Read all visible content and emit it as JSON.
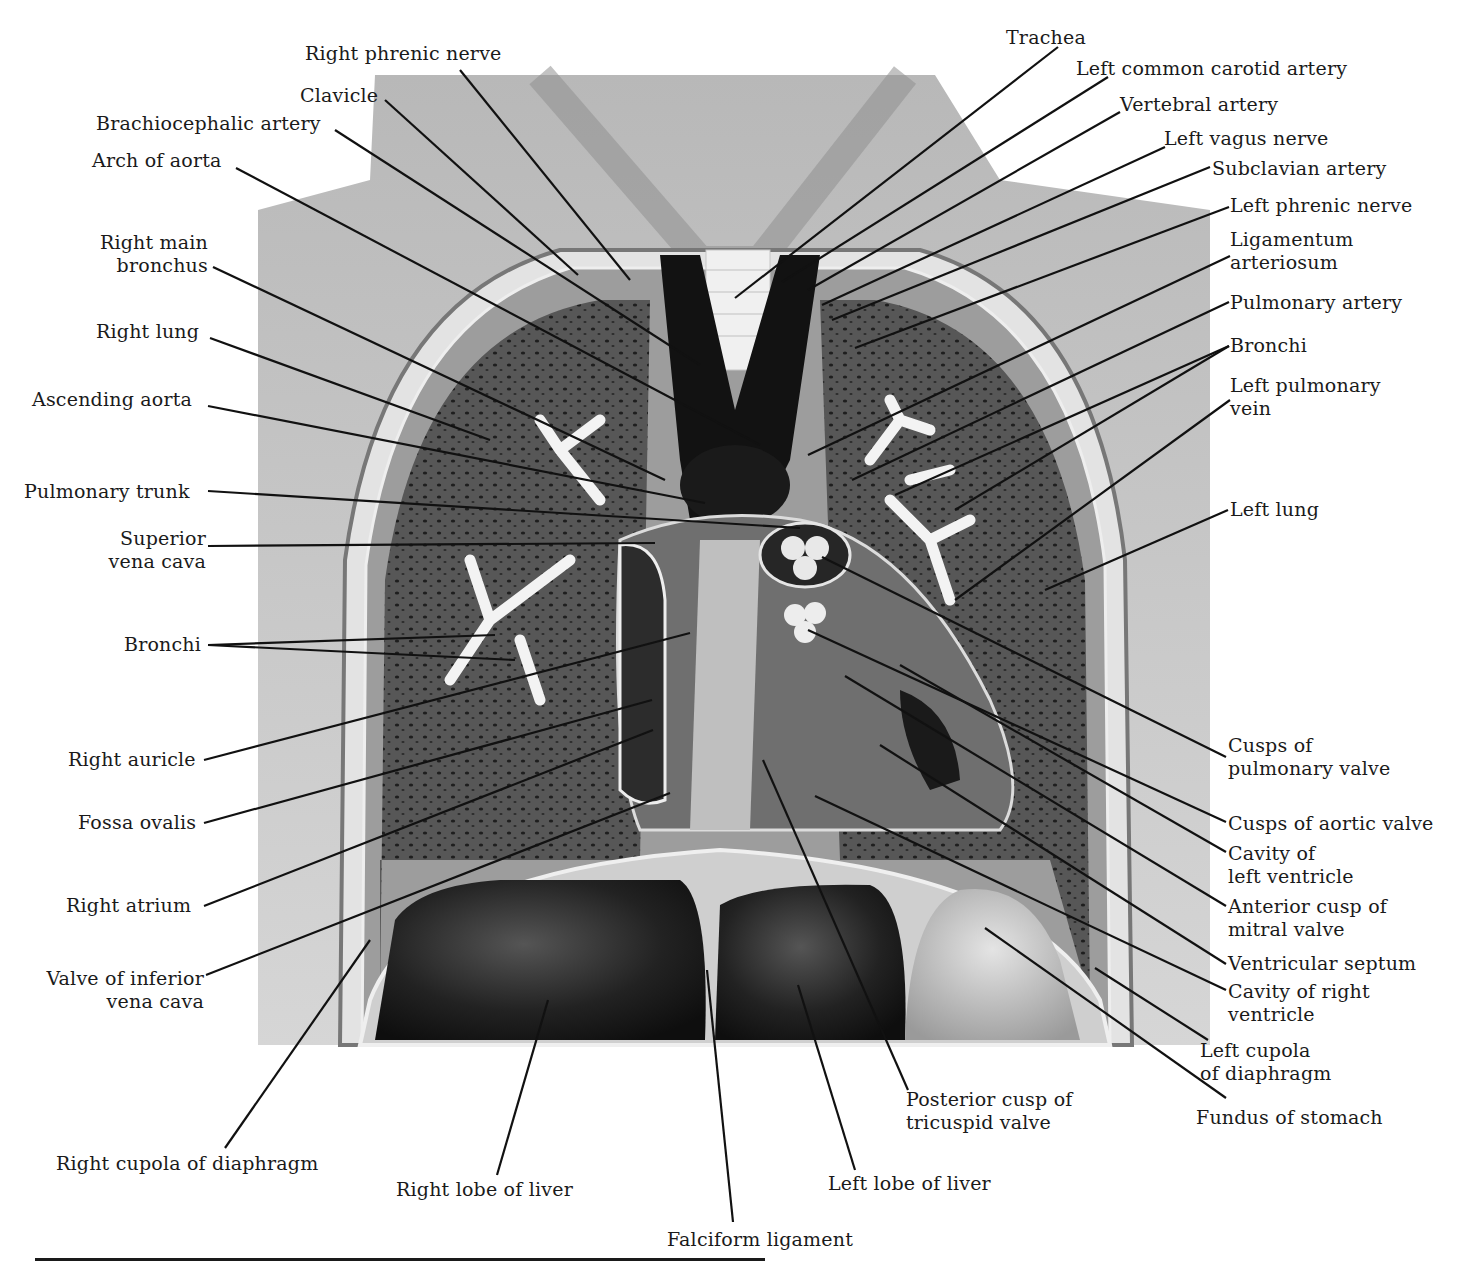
{
  "figure": {
    "colors": {
      "skin": "#c9c9c9",
      "lung_tissue": "#4a4a4a",
      "vessel_dark": "#141414",
      "bronchi": "#f2f2f2",
      "liver": "#1e1e1e",
      "leader_line": "#111111"
    }
  },
  "labels_left": [
    {
      "id": "right-phrenic-nerve",
      "lines": [
        "Right phrenic nerve"
      ],
      "x": 305,
      "y": 42,
      "align": "left",
      "target": [
        630,
        280
      ],
      "anchor": [
        460,
        70
      ]
    },
    {
      "id": "clavicle",
      "lines": [
        "Clavicle"
      ],
      "x": 300,
      "y": 84,
      "align": "left",
      "target": [
        578,
        275
      ],
      "anchor": [
        385,
        100
      ]
    },
    {
      "id": "brachiocephalic-artery",
      "lines": [
        "Brachiocephalic artery"
      ],
      "x": 96,
      "y": 112,
      "align": "left",
      "target": [
        700,
        365
      ],
      "anchor": [
        335,
        130
      ]
    },
    {
      "id": "arch-of-aorta",
      "lines": [
        "Arch of aorta"
      ],
      "x": 92,
      "y": 149,
      "align": "left",
      "target": [
        760,
        445
      ],
      "anchor": [
        236,
        168
      ]
    },
    {
      "id": "right-main-bronchus",
      "lines": [
        "Right main",
        "bronchus"
      ],
      "x": 88,
      "y": 231,
      "align": "right",
      "w": 120,
      "target": [
        665,
        480
      ],
      "anchor": [
        213,
        267
      ]
    },
    {
      "id": "right-lung",
      "lines": [
        "Right lung"
      ],
      "x": 96,
      "y": 320,
      "align": "left",
      "target": [
        490,
        440
      ],
      "anchor": [
        210,
        338
      ]
    },
    {
      "id": "ascending-aorta",
      "lines": [
        "Ascending aorta"
      ],
      "x": 32,
      "y": 388,
      "align": "left",
      "target": [
        705,
        503
      ],
      "anchor": [
        208,
        406
      ]
    },
    {
      "id": "pulmonary-trunk",
      "lines": [
        "Pulmonary trunk"
      ],
      "x": 24,
      "y": 480,
      "align": "left",
      "target": [
        800,
        528
      ],
      "anchor": [
        208,
        491
      ]
    },
    {
      "id": "superior-vena-cava",
      "lines": [
        "Superior",
        "vena cava"
      ],
      "x": 90,
      "y": 527,
      "align": "right",
      "w": 116,
      "target": [
        655,
        543
      ],
      "anchor": [
        208,
        546
      ]
    },
    {
      "id": "bronchi-right",
      "lines": [
        "Bronchi"
      ],
      "x": 124,
      "y": 633,
      "align": "left",
      "target": [
        495,
        635
      ],
      "target2": [
        515,
        660
      ],
      "anchor": [
        208,
        645
      ]
    },
    {
      "id": "right-auricle",
      "lines": [
        "Right auricle"
      ],
      "x": 68,
      "y": 748,
      "align": "left",
      "target": [
        690,
        633
      ],
      "anchor": [
        204,
        760
      ]
    },
    {
      "id": "fossa-ovalis",
      "lines": [
        "Fossa ovalis"
      ],
      "x": 78,
      "y": 811,
      "align": "left",
      "target": [
        652,
        700
      ],
      "anchor": [
        204,
        823
      ]
    },
    {
      "id": "right-atrium",
      "lines": [
        "Right atrium"
      ],
      "x": 66,
      "y": 894,
      "align": "left",
      "target": [
        653,
        730
      ],
      "anchor": [
        204,
        906
      ]
    },
    {
      "id": "valve-of-inferior-vena-cava",
      "lines": [
        "Valve of inferior",
        "vena cava"
      ],
      "x": 28,
      "y": 967,
      "align": "right",
      "w": 176,
      "target": [
        670,
        793
      ],
      "anchor": [
        206,
        975
      ]
    },
    {
      "id": "right-cupola-of-diaphragm",
      "lines": [
        "Right cupola of diaphragm"
      ],
      "x": 56,
      "y": 1152,
      "align": "left",
      "target": [
        370,
        940
      ],
      "anchor": [
        225,
        1148
      ]
    },
    {
      "id": "right-lobe-of-liver",
      "lines": [
        "Right lobe of liver"
      ],
      "x": 396,
      "y": 1178,
      "align": "left",
      "target": [
        548,
        1000
      ],
      "anchor": [
        497,
        1175
      ]
    },
    {
      "id": "falciform-ligament",
      "lines": [
        "Falciform ligament"
      ],
      "x": 667,
      "y": 1228,
      "align": "left",
      "target": [
        707,
        970
      ],
      "anchor": [
        733,
        1222
      ]
    }
  ],
  "labels_right": [
    {
      "id": "trachea",
      "lines": [
        "Trachea"
      ],
      "x": 1006,
      "y": 26,
      "align": "left",
      "target": [
        735,
        298
      ],
      "anchor": [
        1058,
        47
      ]
    },
    {
      "id": "left-common-carotid-artery",
      "lines": [
        "Left common carotid artery"
      ],
      "x": 1076,
      "y": 57,
      "align": "left",
      "target": [
        782,
        282
      ],
      "anchor": [
        1108,
        77
      ]
    },
    {
      "id": "vertebral-artery",
      "lines": [
        "Vertebral artery"
      ],
      "x": 1120,
      "y": 93,
      "align": "left",
      "target": [
        808,
        290
      ],
      "anchor": [
        1120,
        112
      ]
    },
    {
      "id": "left-vagus-nerve",
      "lines": [
        "Left vagus nerve"
      ],
      "x": 1164,
      "y": 127,
      "align": "left",
      "target": [
        822,
        305
      ],
      "anchor": [
        1165,
        147
      ]
    },
    {
      "id": "subclavian-artery",
      "lines": [
        "Subclavian artery"
      ],
      "x": 1212,
      "y": 157,
      "align": "left",
      "target": [
        832,
        320
      ],
      "anchor": [
        1210,
        167
      ]
    },
    {
      "id": "left-phrenic-nerve",
      "lines": [
        "Left phrenic nerve"
      ],
      "x": 1230,
      "y": 194,
      "align": "left",
      "target": [
        855,
        348
      ],
      "anchor": [
        1229,
        207
      ]
    },
    {
      "id": "ligamentum-arteriosum",
      "lines": [
        "Ligamentum",
        "arteriosum"
      ],
      "x": 1230,
      "y": 228,
      "align": "left",
      "target": [
        808,
        455
      ],
      "anchor": [
        1230,
        256
      ]
    },
    {
      "id": "pulmonary-artery",
      "lines": [
        "Pulmonary artery"
      ],
      "x": 1230,
      "y": 291,
      "align": "left",
      "target": [
        852,
        480
      ],
      "anchor": [
        1229,
        302
      ]
    },
    {
      "id": "bronchi-left",
      "lines": [
        "Bronchi"
      ],
      "x": 1230,
      "y": 334,
      "align": "left",
      "target": [
        895,
        495
      ],
      "target2": [
        955,
        510
      ],
      "anchor": [
        1229,
        346
      ]
    },
    {
      "id": "left-pulmonary-vein",
      "lines": [
        "Left pulmonary",
        "vein"
      ],
      "x": 1230,
      "y": 374,
      "align": "left",
      "target": [
        955,
        600
      ],
      "anchor": [
        1230,
        400
      ]
    },
    {
      "id": "left-lung",
      "lines": [
        "Left lung"
      ],
      "x": 1230,
      "y": 498,
      "align": "left",
      "target": [
        1045,
        590
      ],
      "anchor": [
        1228,
        510
      ]
    },
    {
      "id": "cusps-of-pulmonary-valve",
      "lines": [
        "Cusps of",
        "pulmonary valve"
      ],
      "x": 1228,
      "y": 734,
      "align": "left",
      "target": [
        822,
        557
      ],
      "anchor": [
        1226,
        757
      ]
    },
    {
      "id": "cusps-of-aortic-valve",
      "lines": [
        "Cusps of aortic valve"
      ],
      "x": 1228,
      "y": 812,
      "align": "left",
      "target": [
        808,
        630
      ],
      "anchor": [
        1226,
        822
      ]
    },
    {
      "id": "cavity-of-left-ventricle",
      "lines": [
        "Cavity of",
        "left ventricle"
      ],
      "x": 1228,
      "y": 842,
      "align": "left",
      "target": [
        900,
        665
      ],
      "anchor": [
        1226,
        852
      ]
    },
    {
      "id": "anterior-cusp-of-mitral-valve",
      "lines": [
        "Anterior cusp of",
        "mitral valve"
      ],
      "x": 1228,
      "y": 895,
      "align": "left",
      "target": [
        845,
        676
      ],
      "anchor": [
        1226,
        906
      ]
    },
    {
      "id": "ventricular-septum",
      "lines": [
        "Ventricular septum"
      ],
      "x": 1228,
      "y": 952,
      "align": "left",
      "target": [
        880,
        745
      ],
      "anchor": [
        1226,
        964
      ]
    },
    {
      "id": "cavity-of-right-ventricle",
      "lines": [
        "Cavity of right",
        "ventricle"
      ],
      "x": 1228,
      "y": 980,
      "align": "left",
      "target": [
        815,
        796
      ],
      "anchor": [
        1226,
        990
      ]
    },
    {
      "id": "left-cupola-of-diaphragm",
      "lines": [
        "Left cupola",
        "of diaphragm"
      ],
      "x": 1200,
      "y": 1039,
      "align": "left",
      "target": [
        1095,
        968
      ],
      "anchor": [
        1208,
        1040
      ]
    },
    {
      "id": "fundus-of-stomach",
      "lines": [
        "Fundus of stomach"
      ],
      "x": 1196,
      "y": 1106,
      "align": "left",
      "target": [
        985,
        928
      ],
      "anchor": [
        1226,
        1098
      ]
    },
    {
      "id": "posterior-cusp-of-tricuspid-valve",
      "lines": [
        "Posterior cusp of",
        "tricuspid valve"
      ],
      "x": 906,
      "y": 1088,
      "align": "left",
      "target": [
        763,
        760
      ],
      "anchor": [
        908,
        1090
      ]
    },
    {
      "id": "left-lobe-of-liver",
      "lines": [
        "Left lobe of liver"
      ],
      "x": 828,
      "y": 1172,
      "align": "left",
      "target": [
        798,
        985
      ],
      "anchor": [
        855,
        1170
      ]
    }
  ]
}
